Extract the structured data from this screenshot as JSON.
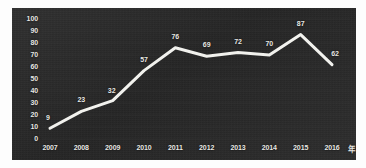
{
  "chart_data": {
    "type": "line",
    "title": "",
    "xlabel": "年",
    "ylabel": "",
    "categories": [
      "2007",
      "2008",
      "2009",
      "2010",
      "2011",
      "2012",
      "2013",
      "2014",
      "2015",
      "2016"
    ],
    "values": [
      9,
      23,
      32,
      57,
      76,
      69,
      72,
      70,
      87,
      62
    ],
    "series": [
      {
        "name": "",
        "values": [
          9,
          23,
          32,
          57,
          76,
          69,
          72,
          70,
          87,
          62
        ]
      }
    ],
    "point_labels": [
      "9",
      "23",
      "32",
      "57",
      "76",
      "69",
      "72",
      "70",
      "87",
      "62"
    ],
    "ylim": [
      0,
      100
    ],
    "yticks": [
      0,
      10,
      20,
      30,
      40,
      50,
      60,
      70,
      80,
      90,
      100
    ],
    "ytick_labels": [
      "0",
      "10",
      "20",
      "30",
      "40",
      "50",
      "60",
      "70",
      "80",
      "90",
      "100"
    ],
    "xtick_labels": [
      "2007",
      "2008",
      "2009",
      "2010",
      "2011",
      "2012",
      "2013",
      "2014",
      "2015",
      "2016"
    ],
    "grid": true,
    "legend": false,
    "legend_position": "none",
    "colors": {
      "panel_background": "#2b2b2b",
      "line": "#f2f2ee",
      "tick_text": "#e8e8e4",
      "grid": "#3a3a3a",
      "figure_background": "#fdfdfd"
    },
    "line_width": 3
  }
}
